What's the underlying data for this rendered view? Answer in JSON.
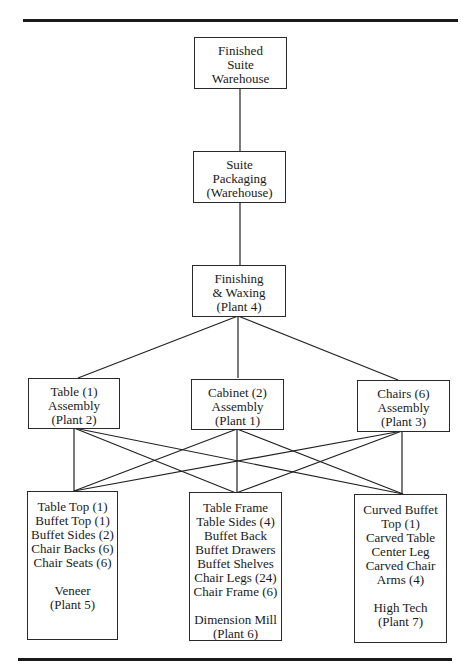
{
  "diagram": {
    "nodes": {
      "finished": {
        "lines": [
          "Finished",
          "Suite",
          "Warehouse"
        ]
      },
      "packaging": {
        "lines": [
          "Suite",
          "Packaging",
          "(Warehouse)"
        ]
      },
      "finishing": {
        "lines": [
          "Finishing",
          "& Waxing",
          "(Plant 4)"
        ]
      },
      "table_assembly": {
        "lines": [
          "Table (1)",
          "Assembly",
          "(Plant 2)"
        ]
      },
      "cabinet_assembly": {
        "lines": [
          "Cabinet (2)",
          "Assembly",
          "(Plant 1)"
        ]
      },
      "chairs_assembly": {
        "lines": [
          "Chairs (6)",
          "Assembly",
          "(Plant 3)"
        ]
      },
      "veneer": {
        "items": [
          "Table Top (1)",
          "Buffet Top (1)",
          "Buffet Sides (2)",
          "Chair Backs (6)",
          "Chair Seats (6)"
        ],
        "plant": [
          "Veneer",
          "(Plant 5)"
        ]
      },
      "dimension_mill": {
        "items": [
          "Table Frame",
          "Table Sides (4)",
          "Buffet Back",
          "Buffet Drawers",
          "Buffet Shelves",
          "Chair Legs (24)",
          "Chair Frame (6)"
        ],
        "plant": [
          "Dimension Mill",
          "(Plant 6)"
        ]
      },
      "high_tech": {
        "items": [
          "Curved Buffet",
          "Top (1)",
          "Carved Table",
          "Center Leg",
          "Carved Chair",
          "Arms (4)"
        ],
        "plant": [
          "High Tech",
          "(Plant 7)"
        ]
      }
    },
    "edges": [
      [
        "finished",
        "packaging"
      ],
      [
        "packaging",
        "finishing"
      ],
      [
        "finishing",
        "table_assembly"
      ],
      [
        "finishing",
        "cabinet_assembly"
      ],
      [
        "finishing",
        "chairs_assembly"
      ],
      [
        "table_assembly",
        "veneer"
      ],
      [
        "table_assembly",
        "dimension_mill"
      ],
      [
        "table_assembly",
        "high_tech"
      ],
      [
        "cabinet_assembly",
        "veneer"
      ],
      [
        "cabinet_assembly",
        "dimension_mill"
      ],
      [
        "cabinet_assembly",
        "high_tech"
      ],
      [
        "chairs_assembly",
        "veneer"
      ],
      [
        "chairs_assembly",
        "dimension_mill"
      ],
      [
        "chairs_assembly",
        "high_tech"
      ]
    ]
  }
}
